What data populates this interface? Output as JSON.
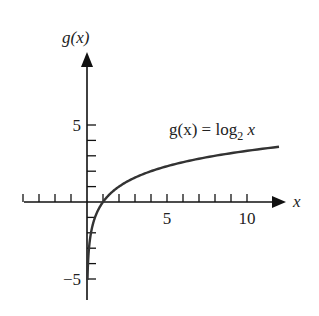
{
  "chart_data": {
    "type": "line",
    "title": "",
    "xlabel": "x",
    "ylabel": "g(x)",
    "annotation": "g(x) = log2 x",
    "annotation_parts": {
      "lhs": "g(x) = log",
      "base": "2",
      "var": " x"
    },
    "function": "log2(x)",
    "x_range_plotted": [
      0.03,
      12
    ],
    "xlim": [
      -5,
      12.5
    ],
    "ylim": [
      -6.3,
      9.5
    ],
    "x_ticks": [
      -4,
      -3,
      -2,
      -1,
      1,
      2,
      3,
      4,
      5,
      6,
      7,
      8,
      9,
      10
    ],
    "x_tick_labels": {
      "5": "5",
      "10": "10"
    },
    "y_ticks": [
      -5,
      -4,
      -3,
      -2,
      -1,
      1,
      2,
      3,
      4,
      5
    ],
    "y_tick_labels": {
      "5": "5",
      "-5": "−5"
    },
    "grid": false,
    "legend": "none",
    "series": [
      {
        "name": "g(x) = log2 x",
        "x": [
          0.03,
          0.0625,
          0.125,
          0.25,
          0.5,
          1,
          2,
          4,
          8,
          12
        ],
        "y": [
          -5.06,
          -4,
          -3,
          -2,
          -1,
          0,
          1,
          2,
          3,
          3.58
        ]
      }
    ],
    "colors": {
      "axes": "#111111",
      "curve": "#333333",
      "text": "#222222"
    }
  }
}
